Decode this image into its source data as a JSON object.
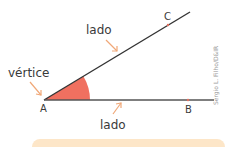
{
  "diagram": {
    "labels": {
      "vertex_label": "vértice",
      "side_top_label": "lado",
      "side_bottom_label": "lado"
    },
    "points": {
      "A": "A",
      "B": "B",
      "C": "C"
    },
    "credit": "Sergio L. Filho/D&IR",
    "colors": {
      "angle_fill": "#f07060",
      "line": "#333333",
      "arrow": "#f0a878",
      "box": "#fde6c8"
    }
  }
}
